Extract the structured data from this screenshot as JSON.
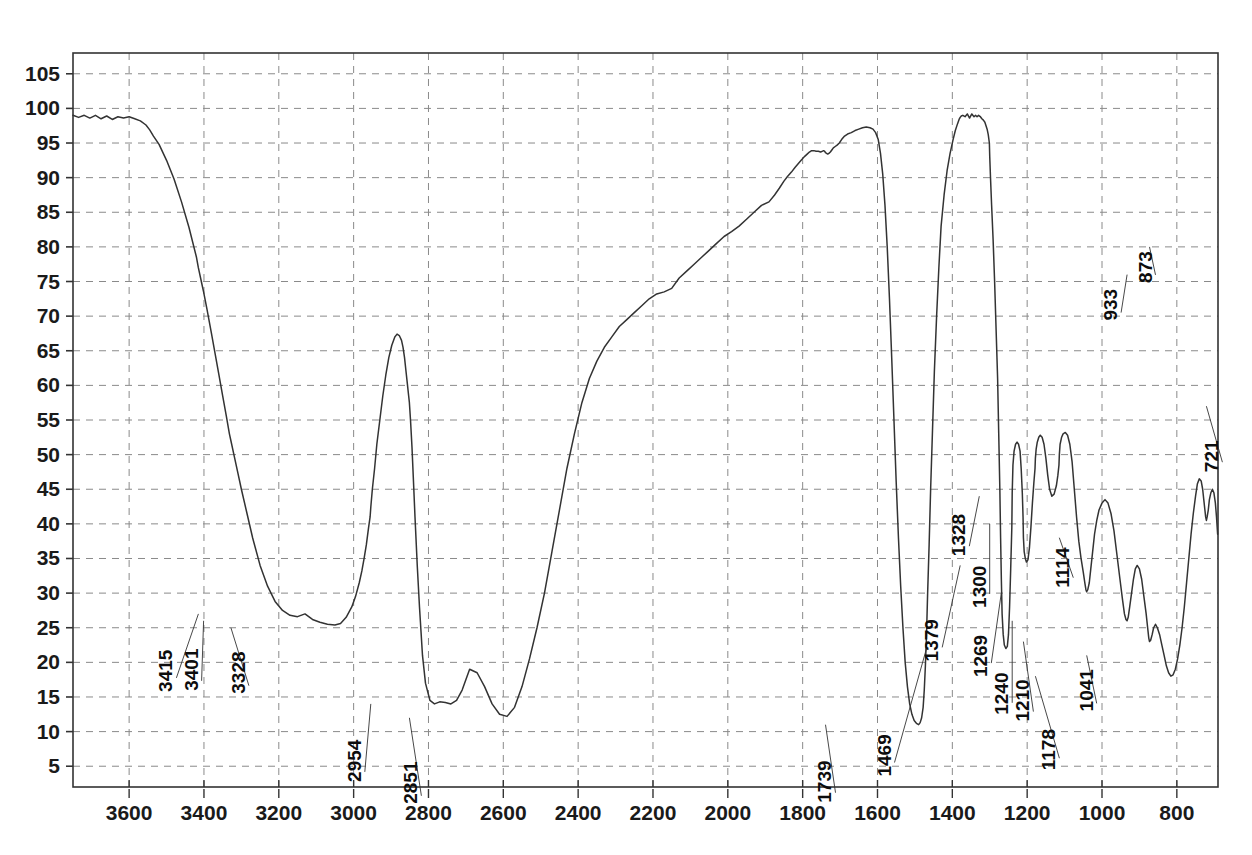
{
  "chart_data": {
    "type": "line",
    "title": "",
    "xlabel": "",
    "ylabel": "",
    "xlim": [
      3750,
      690
    ],
    "ylim": [
      2,
      108
    ],
    "x_ticks": [
      3600,
      3400,
      3200,
      3000,
      2800,
      2600,
      2400,
      2200,
      2000,
      1800,
      1600,
      1400,
      1200,
      1000,
      800
    ],
    "y_ticks": [
      5,
      10,
      15,
      20,
      25,
      30,
      35,
      40,
      45,
      50,
      55,
      60,
      65,
      70,
      75,
      80,
      85,
      90,
      95,
      100,
      105
    ],
    "grid": true,
    "legend": "none",
    "line_color": "#333333",
    "grid_color": "#8a8a8a",
    "axis_color": "#333333",
    "annotations": [
      {
        "label": "3415",
        "wavenumber": 3415,
        "transmittance": 27
      },
      {
        "label": "3401",
        "wavenumber": 3401,
        "transmittance": 26
      },
      {
        "label": "3328",
        "wavenumber": 3328,
        "transmittance": 25
      },
      {
        "label": "2954",
        "wavenumber": 2954,
        "transmittance": 14
      },
      {
        "label": "2851",
        "wavenumber": 2851,
        "transmittance": 12
      },
      {
        "label": "1739",
        "wavenumber": 1739,
        "transmittance": 11
      },
      {
        "label": "1469",
        "wavenumber": 1469,
        "transmittance": 22
      },
      {
        "label": "1379",
        "wavenumber": 1379,
        "transmittance": 34
      },
      {
        "label": "1328",
        "wavenumber": 1328,
        "transmittance": 44
      },
      {
        "label": "1300",
        "wavenumber": 1300,
        "transmittance": 40
      },
      {
        "label": "1269",
        "wavenumber": 1269,
        "transmittance": 30
      },
      {
        "label": "1240",
        "wavenumber": 1240,
        "transmittance": 26
      },
      {
        "label": "1210",
        "wavenumber": 1210,
        "transmittance": 23
      },
      {
        "label": "1178",
        "wavenumber": 1178,
        "transmittance": 18
      },
      {
        "label": "1114",
        "wavenumber": 1114,
        "transmittance": 38
      },
      {
        "label": "1041",
        "wavenumber": 1041,
        "transmittance": 21
      },
      {
        "label": "933",
        "wavenumber": 933,
        "transmittance": 76
      },
      {
        "label": "873",
        "wavenumber": 873,
        "transmittance": 80
      },
      {
        "label": "721",
        "wavenumber": 721,
        "transmittance": 57
      }
    ],
    "x": [
      3750,
      3735,
      3720,
      3705,
      3690,
      3675,
      3660,
      3645,
      3630,
      3615,
      3600,
      3585,
      3570,
      3555,
      3545,
      3535,
      3520,
      3500,
      3480,
      3460,
      3440,
      3420,
      3415,
      3405,
      3401,
      3392,
      3380,
      3370,
      3360,
      3350,
      3340,
      3332,
      3328,
      3320,
      3310,
      3300,
      3285,
      3270,
      3250,
      3230,
      3210,
      3190,
      3170,
      3150,
      3130,
      3110,
      3090,
      3070,
      3050,
      3035,
      3020,
      3005,
      2995,
      2985,
      2978,
      2972,
      2966,
      2960,
      2956,
      2954,
      2950,
      2944,
      2938,
      2930,
      2922,
      2914,
      2906,
      2898,
      2890,
      2884,
      2878,
      2872,
      2868,
      2864,
      2860,
      2856,
      2853,
      2851,
      2848,
      2844,
      2840,
      2836,
      2830,
      2824,
      2816,
      2808,
      2796,
      2784,
      2770,
      2755,
      2740,
      2725,
      2710,
      2690,
      2670,
      2650,
      2630,
      2610,
      2590,
      2570,
      2550,
      2530,
      2510,
      2490,
      2470,
      2450,
      2430,
      2410,
      2390,
      2370,
      2350,
      2330,
      2310,
      2290,
      2270,
      2250,
      2230,
      2210,
      2190,
      2170,
      2150,
      2130,
      2110,
      2090,
      2070,
      2050,
      2030,
      2010,
      1990,
      1970,
      1950,
      1930,
      1910,
      1890,
      1875,
      1862,
      1850,
      1840,
      1830,
      1820,
      1812,
      1804,
      1796,
      1788,
      1782,
      1776,
      1770,
      1764,
      1758,
      1752,
      1748,
      1744,
      1741,
      1739,
      1736,
      1733,
      1730,
      1726,
      1722,
      1718,
      1713,
      1708,
      1702,
      1696,
      1688,
      1680,
      1670,
      1660,
      1650,
      1640,
      1630,
      1620,
      1612,
      1605,
      1598,
      1592,
      1586,
      1580,
      1574,
      1568,
      1562,
      1556,
      1550,
      1544,
      1538,
      1532,
      1526,
      1520,
      1514,
      1508,
      1502,
      1496,
      1490,
      1486,
      1482,
      1478,
      1475,
      1472,
      1469,
      1466,
      1462,
      1458,
      1453,
      1448,
      1442,
      1436,
      1430,
      1422,
      1414,
      1406,
      1398,
      1392,
      1386,
      1382,
      1379,
      1376,
      1372,
      1366,
      1360,
      1354,
      1348,
      1342,
      1338,
      1334,
      1330,
      1328,
      1325,
      1321,
      1317,
      1313,
      1310,
      1307,
      1304,
      1301,
      1300,
      1298,
      1295,
      1291,
      1287,
      1283,
      1279,
      1276,
      1273,
      1271,
      1269,
      1267,
      1264,
      1261,
      1257,
      1253,
      1250,
      1247,
      1244,
      1241,
      1240,
      1238,
      1235,
      1231,
      1227,
      1223,
      1219,
      1216,
      1213,
      1211,
      1210,
      1208,
      1205,
      1202,
      1198,
      1194,
      1190,
      1186,
      1182,
      1179,
      1178,
      1176,
      1173,
      1169,
      1165,
      1160,
      1155,
      1150,
      1145,
      1140,
      1134,
      1128,
      1122,
      1118,
      1115,
      1114,
      1112,
      1108,
      1104,
      1098,
      1092,
      1086,
      1080,
      1074,
      1068,
      1062,
      1056,
      1050,
      1046,
      1043,
      1041,
      1038,
      1034,
      1030,
      1025,
      1020,
      1014,
      1008,
      1000,
      992,
      984,
      976,
      968,
      960,
      952,
      945,
      940,
      936,
      933,
      930,
      926,
      921,
      916,
      911,
      906,
      900,
      894,
      888,
      882,
      878,
      875,
      873,
      870,
      866,
      862,
      857,
      852,
      846,
      840,
      834,
      828,
      822,
      816,
      810,
      804,
      798,
      792,
      786,
      780,
      774,
      768,
      762,
      756,
      750,
      745,
      740,
      735,
      731,
      728,
      725,
      723,
      721,
      719,
      716,
      713,
      709,
      705,
      701,
      697,
      694,
      691
    ],
    "y": [
      99.0,
      98.7,
      99.0,
      98.6,
      99.0,
      98.5,
      98.9,
      98.4,
      98.8,
      98.6,
      98.8,
      98.5,
      98.2,
      97.6,
      96.9,
      96.0,
      94.8,
      92.5,
      89.8,
      86.5,
      82.8,
      78.5,
      77.0,
      74.5,
      73.5,
      71.0,
      67.5,
      64.5,
      61.5,
      58.5,
      55.5,
      53.0,
      52.0,
      50.0,
      47.5,
      45.0,
      41.5,
      38.0,
      34.0,
      31.0,
      28.8,
      27.5,
      26.8,
      26.6,
      27.0,
      26.2,
      25.8,
      25.5,
      25.4,
      25.6,
      26.5,
      28.0,
      29.5,
      31.5,
      33.2,
      35.0,
      37.0,
      39.5,
      41.0,
      42.5,
      45.0,
      48.0,
      51.5,
      55.0,
      58.5,
      61.5,
      64.0,
      65.8,
      67.0,
      67.4,
      67.2,
      66.5,
      65.5,
      64.0,
      62.0,
      60.0,
      58.5,
      57.5,
      55.0,
      51.0,
      46.0,
      41.0,
      34.0,
      28.0,
      21.0,
      17.0,
      14.5,
      14.0,
      14.3,
      14.2,
      14.0,
      14.5,
      16.0,
      19.0,
      18.5,
      16.5,
      14.0,
      12.5,
      12.2,
      13.5,
      16.5,
      20.5,
      25.0,
      30.0,
      36.0,
      42.0,
      48.0,
      53.0,
      57.5,
      61.0,
      63.5,
      65.5,
      67.0,
      68.5,
      69.5,
      70.5,
      71.5,
      72.5,
      73.2,
      73.5,
      74.0,
      75.5,
      76.5,
      77.5,
      78.5,
      79.5,
      80.5,
      81.5,
      82.2,
      83.0,
      84.0,
      85.0,
      86.0,
      86.5,
      87.5,
      88.5,
      89.5,
      90.2,
      90.8,
      91.5,
      92.0,
      92.5,
      93.0,
      93.4,
      93.7,
      93.9,
      93.9,
      93.8,
      93.8,
      93.7,
      93.8,
      93.9,
      93.8,
      93.6,
      93.5,
      93.4,
      93.5,
      93.7,
      94.0,
      94.3,
      94.5,
      94.7,
      95.0,
      95.5,
      96.0,
      96.3,
      96.5,
      96.8,
      97.0,
      97.2,
      97.3,
      97.2,
      97.0,
      96.5,
      95.5,
      93.5,
      90.5,
      86.0,
      80.0,
      72.5,
      64.0,
      55.0,
      46.0,
      38.0,
      31.0,
      25.0,
      20.0,
      16.5,
      14.0,
      12.5,
      11.6,
      11.2,
      11.0,
      11.3,
      12.0,
      13.5,
      16.0,
      19.5,
      24.0,
      30.0,
      37.0,
      45.0,
      53.5,
      62.0,
      70.0,
      77.0,
      83.0,
      87.5,
      91.0,
      93.5,
      95.5,
      96.8,
      97.8,
      98.4,
      98.7,
      98.9,
      99.0,
      98.8,
      99.2,
      98.6,
      99.2,
      98.8,
      99.0,
      98.8,
      99.0,
      98.9,
      98.8,
      98.5,
      98.3,
      98.0,
      97.5,
      97.0,
      96.2,
      95.0,
      93.0,
      90.0,
      86.0,
      81.0,
      75.0,
      68.0,
      61.0,
      53.0,
      45.0,
      38.0,
      32.0,
      27.0,
      24.0,
      22.5,
      22.0,
      22.3,
      24.0,
      28.0,
      33.5,
      39.5,
      44.5,
      48.5,
      50.5,
      51.5,
      51.8,
      51.5,
      50.5,
      48.0,
      44.5,
      41.0,
      38.0,
      36.0,
      35.0,
      34.5,
      34.8,
      36.5,
      39.5,
      43.0,
      46.0,
      48.0,
      49.5,
      50.8,
      51.8,
      52.5,
      52.8,
      52.5,
      51.5,
      49.5,
      47.0,
      45.0,
      44.0,
      44.3,
      45.5,
      47.0,
      48.5,
      50.0,
      51.5,
      52.5,
      53.0,
      53.2,
      52.8,
      51.5,
      49.0,
      45.0,
      41.0,
      37.5,
      35.0,
      33.0,
      31.5,
      30.5,
      30.2,
      30.5,
      31.5,
      33.5,
      36.0,
      38.5,
      40.5,
      42.0,
      43.0,
      43.5,
      43.0,
      41.5,
      39.0,
      35.5,
      32.0,
      29.0,
      27.0,
      26.2,
      26.0,
      26.5,
      28.0,
      30.0,
      32.0,
      33.5,
      34.0,
      33.5,
      32.0,
      29.5,
      27.0,
      25.0,
      23.5,
      23.0,
      23.2,
      24.0,
      25.0,
      25.5,
      25.0,
      24.0,
      22.5,
      21.0,
      19.5,
      18.5,
      18.0,
      18.2,
      19.0,
      20.5,
      22.5,
      25.0,
      28.0,
      31.5,
      35.0,
      38.5,
      41.5,
      44.0,
      45.8,
      46.5,
      46.2,
      45.0,
      43.5,
      42.0,
      41.0,
      40.5,
      41.0,
      42.0,
      43.5,
      44.5,
      45.0,
      44.5,
      43.0,
      41.0,
      38.5,
      36.0,
      33.0,
      30.0,
      27.5,
      25.5,
      23.5,
      22.0,
      21.2,
      21.0,
      21.5,
      23.0,
      25.5,
      29.0,
      33.0,
      38.0,
      44.0,
      51.0,
      58.0,
      64.5,
      70.0,
      74.5,
      78.0,
      80.5,
      82.0,
      82.5,
      82.0,
      80.5,
      78.0,
      76.2,
      76.0,
      76.5,
      78.0,
      80.5,
      83.0,
      84.8,
      85.5,
      85.8,
      86.0,
      86.2,
      86.5,
      87.0,
      88.0,
      89.5,
      91.5,
      93.5,
      94.5,
      94.2,
      92.0,
      88.0,
      84.0,
      81.5,
      80.5,
      81.0,
      83.0,
      86.0,
      89.5,
      92.5,
      94.8,
      96.3,
      97.0,
      97.2,
      96.8,
      96.0,
      96.5,
      97.0,
      96.5,
      95.5,
      94.0,
      92.0,
      91.0,
      91.5,
      92.0,
      91.0,
      88.5,
      85.0,
      81.0,
      77.0,
      73.0,
      69.0,
      65.5,
      63.0,
      61.0,
      59.5,
      58.5,
      57.5,
      57.2,
      57.0,
      58.0,
      61.0,
      66.0,
      72.0,
      77.5,
      81.0,
      82.5,
      83.0,
      82.5,
      81.0,
      79.0,
      77.0,
      75.5,
      75.0
    ]
  }
}
